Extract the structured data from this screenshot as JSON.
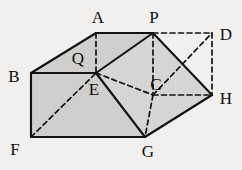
{
  "figure": {
    "kind": "solid-geometry-diagram",
    "canvas": {
      "width": 242,
      "height": 170
    },
    "colors": {
      "background": "#f1f0ee",
      "face_fill": "#d2d1cf",
      "face_fill_light": "#dcdbd9",
      "stroke": "#121212",
      "hidden_stroke": "#121212",
      "label_color": "#0d0d0d"
    },
    "stroke_width": 2.1,
    "hidden_stroke_width": 1.7,
    "dash_pattern": "5,3.5"
  },
  "points": {
    "A": {
      "label": "A",
      "x": 96,
      "y": 33,
      "label_x": 98,
      "label_y": 17
    },
    "P": {
      "label": "P",
      "x": 153,
      "y": 33,
      "label_x": 154,
      "label_y": 17
    },
    "D": {
      "label": "D",
      "x": 212,
      "y": 33,
      "label_x": 226,
      "label_y": 34
    },
    "B": {
      "label": "B",
      "x": 31,
      "y": 73,
      "label_x": 14,
      "label_y": 76
    },
    "Q": {
      "label": "Q",
      "x": 78,
      "y": 58,
      "label_x": 78,
      "label_y": 58
    },
    "E": {
      "label": "E",
      "x": 96,
      "y": 73,
      "label_x": 94,
      "label_y": 89
    },
    "C": {
      "label": "C",
      "x": 153,
      "y": 95,
      "label_x": 156,
      "label_y": 84
    },
    "H": {
      "label": "H",
      "x": 212,
      "y": 95,
      "label_x": 226,
      "label_y": 98
    },
    "F": {
      "label": "F",
      "x": 31,
      "y": 137,
      "label_x": 15,
      "label_y": 149
    },
    "G": {
      "label": "G",
      "x": 145,
      "y": 137,
      "label_x": 148,
      "label_y": 151
    }
  },
  "faces": [
    {
      "name": "face-B-A-P-E",
      "polygon": "31,73 96,33 153,33 96,73",
      "fill": "#d2d1cf"
    },
    {
      "name": "face-E-P-H-G",
      "polygon": "96,73 153,33 212,95 145,137",
      "fill": "#d6d5d3"
    },
    {
      "name": "face-B-E-G-F",
      "polygon": "31,73 96,73 145,137 31,137",
      "fill": "#d2d1cf"
    }
  ],
  "solid_edges": [
    {
      "name": "edge-A-P",
      "from": "A",
      "to": "P"
    },
    {
      "name": "edge-B-A",
      "from": "B",
      "to": "A"
    },
    {
      "name": "edge-B-E",
      "from": "B",
      "to": "E"
    },
    {
      "name": "edge-E-P",
      "from": "E",
      "to": "P"
    },
    {
      "name": "edge-P-H",
      "from": "P",
      "to": "H"
    },
    {
      "name": "edge-E-G",
      "from": "E",
      "to": "G"
    },
    {
      "name": "edge-G-H",
      "from": "G",
      "to": "H"
    },
    {
      "name": "edge-B-F",
      "from": "B",
      "to": "F"
    },
    {
      "name": "edge-F-G",
      "from": "F",
      "to": "G"
    }
  ],
  "hidden_edges": [
    {
      "name": "hidden-edge-A-E",
      "from": "A",
      "to": "E"
    },
    {
      "name": "hidden-edge-P-D",
      "from": "P",
      "to": "D"
    },
    {
      "name": "hidden-edge-D-H",
      "from": "D",
      "to": "H"
    },
    {
      "name": "hidden-edge-P-C",
      "from": "P",
      "to": "C"
    },
    {
      "name": "hidden-edge-E-C",
      "from": "E",
      "to": "C"
    },
    {
      "name": "hidden-edge-C-H",
      "from": "C",
      "to": "H"
    },
    {
      "name": "hidden-edge-C-G",
      "from": "C",
      "to": "G"
    },
    {
      "name": "hidden-edge-C-D",
      "from": "C",
      "to": "D"
    },
    {
      "name": "hidden-edge-F-E",
      "from": "F",
      "to": "E"
    }
  ],
  "label_order": [
    "A",
    "P",
    "D",
    "B",
    "Q",
    "E",
    "C",
    "H",
    "F",
    "G"
  ]
}
